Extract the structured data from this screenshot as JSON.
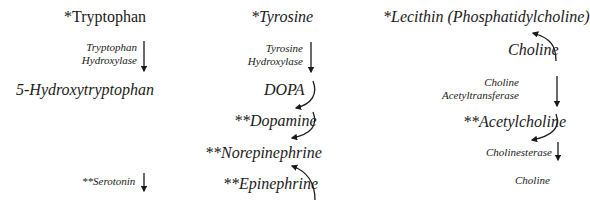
{
  "pathways": {
    "tryptophan": {
      "precursor": "*Tryptophan",
      "enzyme_line1": "Tryptophan",
      "enzyme_line2": "Hydroxylase",
      "intermediate": "5-Hydroxytryptophan",
      "product": "**Serotonin"
    },
    "tyrosine": {
      "precursor": "*Tyrosine",
      "enzyme_line1": "Tyrosine",
      "enzyme_line2": "Hydroxylase",
      "intermediate": "DOPA",
      "dopamine": "**Dopamine",
      "norepinephrine": "**Norepinephrine",
      "epinephrine": "**Epinephrine"
    },
    "lecithin": {
      "precursor": "*Lecithin (Phosphatidylcholine)",
      "choline_top": "Choline",
      "enzyme_line1": "Choline",
      "enzyme_line2": "Acetyltransferase",
      "acetylcholine": "**Acetylcholine",
      "degrading_enzyme": "Cholinesterase",
      "choline_bottom": "Choline"
    }
  },
  "colors": {
    "text": "#1a1a1a",
    "arrow": "#1a1a1a",
    "background": "#ffffff"
  }
}
